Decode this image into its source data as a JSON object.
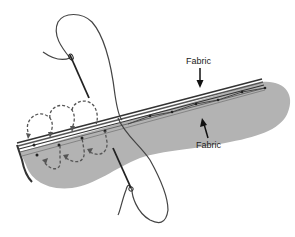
{
  "diagram": {
    "labels": {
      "top_fabric": "Fabric",
      "bottom_fabric": "Fabric"
    },
    "colors": {
      "fabric_fill": "#b3b3b3",
      "fabric_edge": "#555555",
      "thread": "#444444",
      "stitch_dots": "#222222",
      "dashed_path": "#555555",
      "background": "#ffffff"
    },
    "elements": [
      "folded fabric edge with layered top hem",
      "needle with thread (top-left)",
      "needle with thread (bottom-center)",
      "dashed looping stitch path with arrows",
      "running stitches along hem"
    ]
  }
}
